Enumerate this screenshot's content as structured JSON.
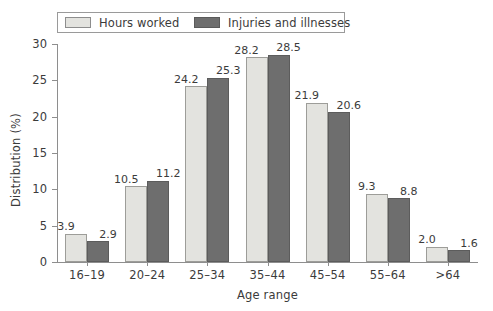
{
  "chart_data": {
    "type": "bar",
    "title": "",
    "subtitle": "",
    "xlabel": "Age range",
    "ylabel": "Distribution (%)",
    "categories": [
      "16–19",
      "20–24",
      "25–34",
      "35–44",
      "45–54",
      "55–64",
      ">64"
    ],
    "series": [
      {
        "name": "Hours worked",
        "color": "#e3e3df",
        "values": [
          3.9,
          10.5,
          24.2,
          28.2,
          21.9,
          9.3,
          2.0
        ],
        "labels": [
          "3.9",
          "10.5",
          "24.2",
          "28.2",
          "21.9",
          "9.3",
          "2.0"
        ]
      },
      {
        "name": "Injuries and illnesses",
        "color": "#6e6e6e",
        "values": [
          2.9,
          11.2,
          25.3,
          28.5,
          20.6,
          8.8,
          1.6
        ],
        "labels": [
          "2.9",
          "11.2",
          "25.3",
          "28.5",
          "20.6",
          "8.8",
          "1.6"
        ]
      }
    ],
    "ylim": [
      0,
      30
    ],
    "yticks": [
      0,
      5,
      10,
      15,
      20,
      25,
      30
    ],
    "ytick_labels": [
      "0",
      "5",
      "10",
      "15",
      "20",
      "25",
      "30"
    ],
    "grid": false,
    "legend_position": "top-left-boxed"
  },
  "legend": {
    "entries": [
      {
        "label": "Hours worked",
        "swatch": "light-grey-swatch"
      },
      {
        "label": "Injuries and illnesses",
        "swatch": "dark-grey-swatch"
      }
    ]
  }
}
